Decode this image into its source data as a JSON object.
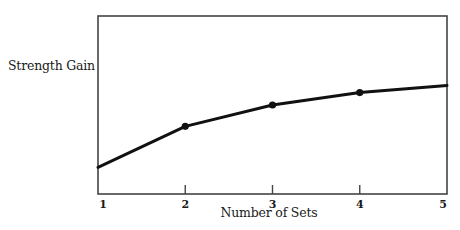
{
  "chart_data": {
    "type": "line",
    "title": "",
    "xlabel": "Number of Sets",
    "ylabel": "Strength Gain",
    "x": [
      1,
      2,
      3,
      4,
      5
    ],
    "categories": [
      "1",
      "2",
      "3",
      "4",
      "5"
    ],
    "series": [
      {
        "name": "Strength Gain",
        "values": [
          15,
          38,
          50,
          57,
          61
        ],
        "markers_at": [
          2,
          3,
          4
        ]
      }
    ],
    "xlim": [
      1,
      5
    ],
    "ylim": [
      0,
      100
    ],
    "y_units": "relative (no numeric scale shown)",
    "grid": false,
    "legend": "none",
    "x_ticks": [
      "1",
      "2",
      "3",
      "4",
      "5"
    ]
  },
  "axes": {
    "ylabel": "Strength Gain",
    "xlabel": "Number of Sets",
    "ticks": [
      "1",
      "2",
      "3",
      "4",
      "5"
    ]
  },
  "colors": {
    "line": "#111111",
    "frame": "#444444",
    "background": "#ffffff"
  }
}
